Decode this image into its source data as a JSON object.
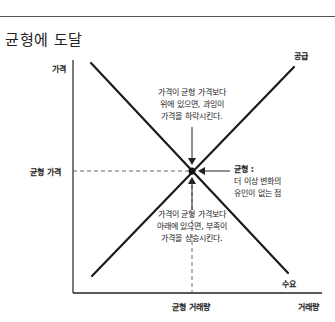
{
  "title": "균형에 도달",
  "axes": {
    "y_label": "가격",
    "x_label": "거래량",
    "equilibrium_price_label": "균형 가격",
    "equilibrium_quantity_label": "균형 거래량"
  },
  "curves": {
    "supply_label": "공급",
    "demand_label": "수요"
  },
  "annotations": {
    "above": [
      "가격이 균형 가격보다",
      "위에 있으면, 과잉이",
      "가격을 하락시킨다."
    ],
    "below": [
      "가격이 균형 가격보다",
      "아래에 있으면, 부족이",
      "가격을 상승시킨다."
    ],
    "equilibrium": [
      "균형 :",
      "더 이상 변화의",
      "유인이 없는 점"
    ]
  },
  "colors": {
    "line": "#1a1a1a",
    "dashed": "#444444",
    "background": "#ffffff"
  }
}
